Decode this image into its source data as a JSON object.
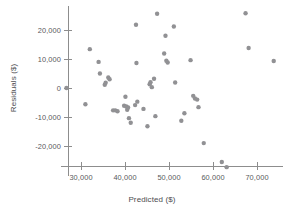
{
  "chart_data": {
    "type": "scatter",
    "title": "",
    "xlabel": "Predicted ($)",
    "ylabel": "Residuals ($)",
    "xlim": [
      25500,
      76000
    ],
    "ylim": [
      -29000,
      27500
    ],
    "grid": false,
    "legend": null,
    "marker_color": "#919194",
    "axis_color": "#8d8d8d",
    "text_color": "#59595c",
    "xticks": [
      30000,
      40000,
      50000,
      60000,
      70000
    ],
    "xtick_labels": [
      "30,000",
      "40,000",
      "50,000",
      "60,000",
      "70,000"
    ],
    "yticks": [
      20000,
      10000,
      0,
      -10000,
      -20000
    ],
    "ytick_labels": [
      "20,000",
      "10,000",
      "0",
      "-10,000",
      "-20,000"
    ],
    "points": [
      {
        "x": 26700,
        "y": 0
      },
      {
        "x": 31000,
        "y": -5600
      },
      {
        "x": 32000,
        "y": 13400
      },
      {
        "x": 34000,
        "y": 9000
      },
      {
        "x": 34300,
        "y": 5000
      },
      {
        "x": 35400,
        "y": 1100
      },
      {
        "x": 35600,
        "y": 1800
      },
      {
        "x": 36200,
        "y": 3600
      },
      {
        "x": 36500,
        "y": 3000
      },
      {
        "x": 37300,
        "y": -7700
      },
      {
        "x": 37800,
        "y": -7700
      },
      {
        "x": 38300,
        "y": -8000
      },
      {
        "x": 39800,
        "y": -6100
      },
      {
        "x": 40100,
        "y": -3000
      },
      {
        "x": 40300,
        "y": -6400
      },
      {
        "x": 40500,
        "y": -7500
      },
      {
        "x": 40700,
        "y": -6700
      },
      {
        "x": 40900,
        "y": -10400
      },
      {
        "x": 41300,
        "y": -12000
      },
      {
        "x": 42300,
        "y": -5900
      },
      {
        "x": 42500,
        "y": 21800
      },
      {
        "x": 42600,
        "y": 8600
      },
      {
        "x": 42800,
        "y": -4700
      },
      {
        "x": 44200,
        "y": -7200
      },
      {
        "x": 45100,
        "y": -13200
      },
      {
        "x": 45600,
        "y": 1300
      },
      {
        "x": 45800,
        "y": 2000
      },
      {
        "x": 46100,
        "y": 300
      },
      {
        "x": 46600,
        "y": 3200
      },
      {
        "x": 46900,
        "y": -9700
      },
      {
        "x": 47300,
        "y": 25600
      },
      {
        "x": 48900,
        "y": 11900
      },
      {
        "x": 49200,
        "y": 18000
      },
      {
        "x": 49400,
        "y": 9400
      },
      {
        "x": 49700,
        "y": 8800
      },
      {
        "x": 51100,
        "y": 21200
      },
      {
        "x": 51400,
        "y": 1900
      },
      {
        "x": 52800,
        "y": -11300
      },
      {
        "x": 53500,
        "y": -8700
      },
      {
        "x": 54900,
        "y": 9600
      },
      {
        "x": 55500,
        "y": -2700
      },
      {
        "x": 55900,
        "y": -3600
      },
      {
        "x": 56400,
        "y": -4000
      },
      {
        "x": 56700,
        "y": -6600
      },
      {
        "x": 57900,
        "y": -19000
      },
      {
        "x": 62000,
        "y": -25500
      },
      {
        "x": 63100,
        "y": -27300
      },
      {
        "x": 67400,
        "y": 25800
      },
      {
        "x": 68100,
        "y": 13800
      },
      {
        "x": 73800,
        "y": 9300
      }
    ]
  }
}
